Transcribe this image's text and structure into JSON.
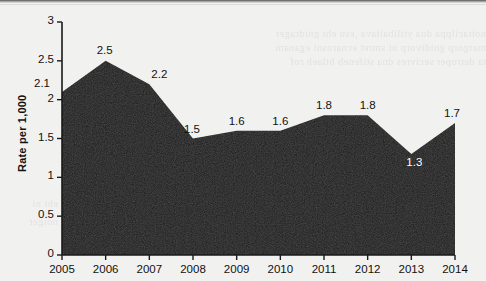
{
  "chart_data": {
    "type": "area",
    "title": "",
    "xlabel": "",
    "ylabel": "Rate per 1,000",
    "categories": [
      "2005",
      "2006",
      "2007",
      "2008",
      "2009",
      "2010",
      "2011",
      "2012",
      "2013",
      "2014"
    ],
    "values": [
      2.1,
      2.5,
      2.2,
      1.5,
      1.6,
      1.6,
      1.8,
      1.8,
      1.3,
      1.7
    ],
    "point_labels": [
      "2.1",
      "2.5",
      "2.2",
      "1.5",
      "1.6",
      "1.6",
      "1.8",
      "1.8",
      "1.3",
      "1.7"
    ],
    "ylim": [
      0,
      3
    ],
    "yticks": [
      0,
      0.5,
      1,
      1.5,
      2,
      2.5,
      3
    ],
    "ytick_labels": [
      "0",
      "0.5",
      "1",
      "1.5",
      "2",
      "2.5",
      "3"
    ],
    "grid": false,
    "legend": null,
    "series_color": "#1a1a1a",
    "background_color": "#f1f1f0",
    "axis_color": "#1a1a1a"
  },
  "background_bleed": {
    "line1": "noitacilppa dna ytilibaliava ,esu eht gnidrager",
    "line2": "margorp gnidivorp ni smret ecnarusni eganam",
    "line3": "ta detroper secivres dna stifeneb htlaeh rof",
    "line4": "eht ni",
    "line5": "noiger"
  }
}
